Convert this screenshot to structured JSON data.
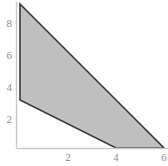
{
  "chart_data": {
    "type": "area",
    "title": "",
    "xlabel": "",
    "ylabel": "",
    "xlim": [
      0,
      6.6
    ],
    "ylim": [
      0,
      9.4
    ],
    "grid": false,
    "legend": null,
    "x_ticks": [
      2,
      4,
      6
    ],
    "x_tick_labels": [
      "2",
      "4",
      "6"
    ],
    "y_ticks": [
      2,
      4,
      6,
      8
    ],
    "y_tick_labels": [
      "2",
      "4",
      "6",
      "8"
    ],
    "series": [
      {
        "name": "shaded-region",
        "type": "polygon",
        "fill_color": "#c0c0c0",
        "edge_color": "#3a3a3a",
        "points": [
          {
            "x": 0,
            "y": 9
          },
          {
            "x": 6,
            "y": 0
          },
          {
            "x": 4,
            "y": 0
          },
          {
            "x": 0,
            "y": 3
          }
        ]
      }
    ],
    "axis_color": "#c9c9c9",
    "tick_label_color": "#8a8a8a",
    "background_color": "#ffffff"
  },
  "axes": {
    "y_labels": [
      {
        "value": "8",
        "top": 18
      },
      {
        "value": "6",
        "top": 50
      },
      {
        "value": "4",
        "top": 82
      },
      {
        "value": "2",
        "top": 114
      }
    ],
    "x_labels": [
      {
        "value": "2",
        "left": 61
      },
      {
        "value": "4",
        "left": 109
      },
      {
        "value": "6",
        "left": 157
      }
    ]
  }
}
